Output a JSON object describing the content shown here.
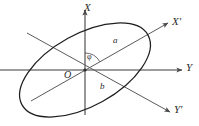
{
  "figure": {
    "background_color": "#ffffff",
    "stroke_color": "#4a4a4a",
    "ellipse_color": "#2b2b2b",
    "label_color": "#2b2b2b"
  },
  "labels": {
    "axis_x": "X",
    "axis_x_prime": "X′",
    "axis_y": "Y",
    "axis_y_prime": "Y′",
    "semi_major": "a",
    "semi_minor": "b",
    "origin": "O",
    "angle": "φ"
  },
  "geometry": {
    "origin": {
      "x": 85,
      "y": 70
    },
    "axis_x": {
      "from": {
        "x": 85,
        "y": 115
      },
      "to": {
        "x": 85,
        "y": 8
      },
      "arrow": "up"
    },
    "axis_y": {
      "from": {
        "x": 0,
        "y": 70
      },
      "to": {
        "x": 184,
        "y": 70
      },
      "arrow": "right"
    },
    "axis_x_prime": {
      "from": {
        "x": 31,
        "y": 101
      },
      "to": {
        "x": 170,
        "y": 22
      },
      "arrow": "upper-right"
    },
    "axis_y_prime": {
      "from": {
        "x": 27,
        "y": 33
      },
      "to": {
        "x": 172,
        "y": 113
      },
      "arrow": "lower-right"
    },
    "ellipse": {
      "center": {
        "x": 85,
        "y": 70
      },
      "semi_major": 72,
      "semi_minor": 36,
      "rotation_deg": -29
    },
    "angle_arc": {
      "center": {
        "x": 85,
        "y": 70
      },
      "radius": 17,
      "start_deg": -90,
      "end_deg": -29
    }
  }
}
